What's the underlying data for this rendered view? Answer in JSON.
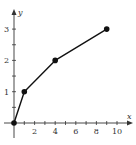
{
  "chart_data": {
    "type": "line",
    "title": "",
    "xlabel": "x",
    "ylabel": "y",
    "x": [
      0,
      1,
      4,
      9
    ],
    "series": [
      {
        "name": "y = sqrt(x)",
        "values": [
          0,
          1,
          2,
          3
        ]
      }
    ],
    "xlim": [
      0,
      11
    ],
    "ylim": [
      0,
      3.5
    ],
    "x_ticks": [
      2,
      4,
      6,
      8,
      10
    ],
    "x_minor_ticks": [
      1,
      3,
      5,
      7,
      9
    ],
    "y_ticks": [
      1,
      2,
      3
    ],
    "y_minor_ticks": [
      0.5,
      1.5,
      2.5
    ],
    "grid": false,
    "legend": "none",
    "markers": "filled-circle"
  },
  "colors": {
    "line": "#111111",
    "axis": "#333333",
    "background": "#ffffff"
  },
  "labels": {
    "x_axis": "x",
    "y_axis": "y",
    "x_tick_labels": [
      "2",
      "4",
      "6",
      "8",
      "10"
    ],
    "y_tick_labels": [
      "1",
      "2",
      "3"
    ]
  }
}
